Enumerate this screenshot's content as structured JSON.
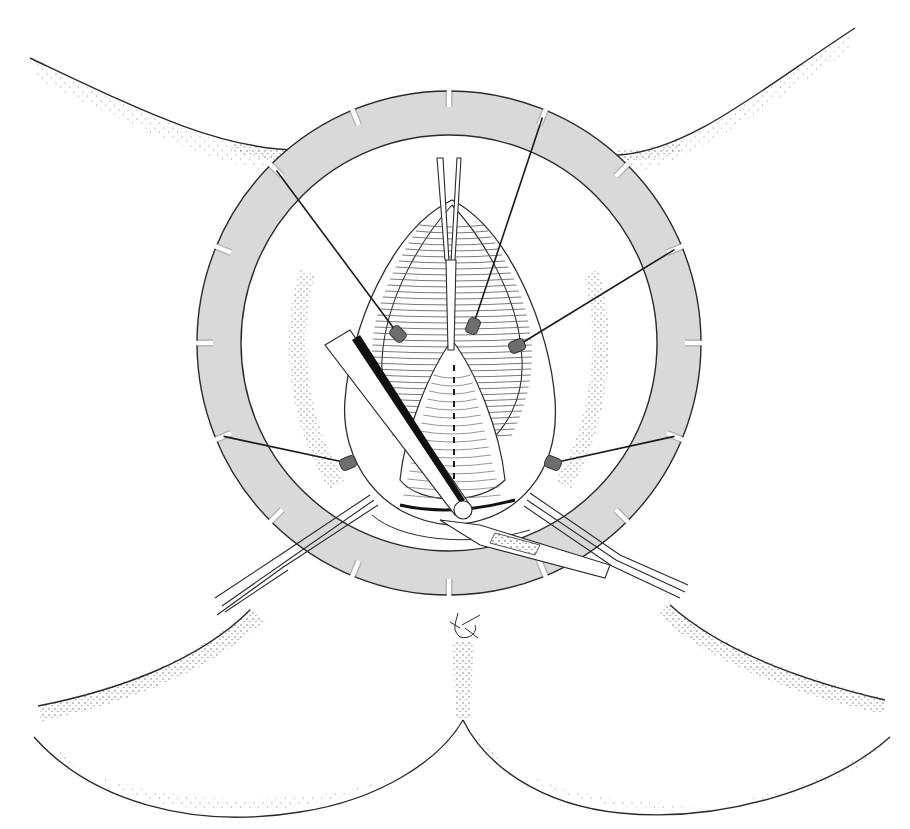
{
  "figure": {
    "kind": "surgical line-art illustration",
    "description": "Ring retractor with elastic stay hooks exposing the operative field; forceps and scalpel in use",
    "text_labels": []
  },
  "colors": {
    "background": "#ffffff",
    "line": "#2a2a2a",
    "ring_fill": "#d9d9d9",
    "stay_hook": "#6e6e6e",
    "stipple": "#333333"
  },
  "ring": {
    "center": [
      449,
      343
    ],
    "outer_radius": 252,
    "inner_radius": 208,
    "notch_count": 16
  },
  "stays": [
    {
      "name": "upper-left",
      "ring_angle_deg": -135,
      "hook": [
        398,
        334
      ]
    },
    {
      "name": "upper-right-steep",
      "ring_angle_deg": -67.5,
      "hook": [
        473,
        326
      ]
    },
    {
      "name": "right",
      "ring_angle_deg": -22.5,
      "hook": [
        517,
        346
      ]
    },
    {
      "name": "lower-left",
      "ring_angle_deg": 157.5,
      "hook": [
        348,
        463
      ]
    },
    {
      "name": "lower-right",
      "ring_angle_deg": 22.5,
      "hook": [
        553,
        463
      ]
    }
  ],
  "instruments": [
    {
      "name": "forceps-top",
      "description": "Tissue forceps entering from above"
    },
    {
      "name": "retractor-blade",
      "description": "Angled blade retractor from upper left"
    },
    {
      "name": "forceps-lower-left",
      "description": "Forceps from lower left"
    },
    {
      "name": "forceps-lower-right",
      "description": "Forceps from lower right"
    },
    {
      "name": "scalpel",
      "description": "Scalpel from lower right"
    }
  ]
}
